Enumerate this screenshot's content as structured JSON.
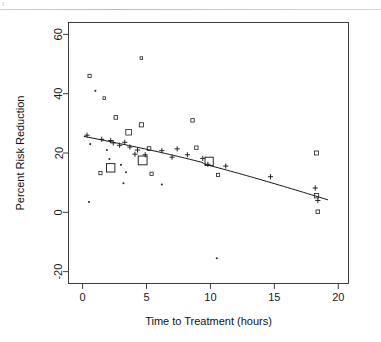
{
  "page": {
    "header_faint_text": "",
    "corner_mark": "I"
  },
  "chart_data": {
    "type": "scatter",
    "title": "",
    "xlabel": "Time to Treatment (hours)",
    "ylabel": "Percent Risk Reduction",
    "xlim": [
      -1.1,
      20.8
    ],
    "ylim": [
      -24,
      64
    ],
    "xticks": [
      0,
      5,
      10,
      15,
      20
    ],
    "xtick_labels": [
      "0",
      "5",
      "10",
      "15",
      "20"
    ],
    "yticks": [
      -20,
      0,
      20,
      40,
      60
    ],
    "ytick_labels": [
      "-20",
      "0",
      "20",
      "40",
      "60"
    ],
    "grid": false,
    "legend": null,
    "marker_styles": {
      "square": "open square (study estimate, size ~ weight)",
      "plus": "plus / cross",
      "dot": "small filled dot"
    },
    "series": [
      {
        "name": "Trials (square markers, size proportional to weight)",
        "marker": "square",
        "points": [
          {
            "x": 0.55,
            "y": 46.0,
            "size": 3.2
          },
          {
            "x": 4.6,
            "y": 52.0,
            "size": 2.6
          },
          {
            "x": 1.7,
            "y": 38.5,
            "size": 2.6
          },
          {
            "x": 2.6,
            "y": 32.0,
            "size": 3.6
          },
          {
            "x": 4.6,
            "y": 29.5,
            "size": 4.2
          },
          {
            "x": 3.6,
            "y": 27.0,
            "size": 5.6
          },
          {
            "x": 8.6,
            "y": 31.0,
            "size": 3.4
          },
          {
            "x": 18.3,
            "y": 20.0,
            "size": 4.0
          },
          {
            "x": 5.2,
            "y": 21.5,
            "size": 3.6
          },
          {
            "x": 8.9,
            "y": 21.8,
            "size": 3.4
          },
          {
            "x": 2.2,
            "y": 15.0,
            "size": 8.4
          },
          {
            "x": 4.7,
            "y": 17.5,
            "size": 8.8
          },
          {
            "x": 9.9,
            "y": 17.2,
            "size": 8.2
          },
          {
            "x": 1.4,
            "y": 13.2,
            "size": 3.2
          },
          {
            "x": 5.4,
            "y": 13.0,
            "size": 3.2
          },
          {
            "x": 10.6,
            "y": 12.6,
            "size": 3.2
          },
          {
            "x": 18.3,
            "y": 5.6,
            "size": 4.4
          },
          {
            "x": 18.4,
            "y": 0.2,
            "size": 3.6
          }
        ]
      },
      {
        "name": "Trials (plus markers)",
        "marker": "plus",
        "points": [
          {
            "x": 0.35,
            "y": 26.0
          },
          {
            "x": 1.5,
            "y": 24.6
          },
          {
            "x": 2.2,
            "y": 24.2
          },
          {
            "x": 2.4,
            "y": 23.4
          },
          {
            "x": 2.9,
            "y": 22.6
          },
          {
            "x": 3.3,
            "y": 23.6
          },
          {
            "x": 3.7,
            "y": 22.0
          },
          {
            "x": 4.3,
            "y": 21.0
          },
          {
            "x": 4.1,
            "y": 19.6
          },
          {
            "x": 4.9,
            "y": 19.4
          },
          {
            "x": 6.2,
            "y": 20.8
          },
          {
            "x": 7.0,
            "y": 18.6
          },
          {
            "x": 7.4,
            "y": 21.4
          },
          {
            "x": 8.2,
            "y": 19.4
          },
          {
            "x": 9.4,
            "y": 18.2
          },
          {
            "x": 9.8,
            "y": 16.2
          },
          {
            "x": 11.2,
            "y": 15.6
          },
          {
            "x": 14.7,
            "y": 12.0
          },
          {
            "x": 18.2,
            "y": 8.2
          },
          {
            "x": 18.4,
            "y": 4.0
          }
        ]
      },
      {
        "name": "Trials (small dot markers)",
        "marker": "dot",
        "points": [
          {
            "x": 1.0,
            "y": 41.0
          },
          {
            "x": 0.6,
            "y": 23.0
          },
          {
            "x": 1.9,
            "y": 21.0
          },
          {
            "x": 2.1,
            "y": 18.0
          },
          {
            "x": 3.0,
            "y": 16.0
          },
          {
            "x": 3.4,
            "y": 13.5
          },
          {
            "x": 3.2,
            "y": 9.8
          },
          {
            "x": 6.2,
            "y": 9.4
          },
          {
            "x": 10.5,
            "y": -15.5
          },
          {
            "x": 0.5,
            "y": 3.5
          }
        ]
      }
    ],
    "fit_line": {
      "name": "fitted meta-regression line",
      "x": [
        0.1,
        19.2
      ],
      "y": [
        25.6,
        5.2
      ],
      "curvature": "slightly concave (gentle downward curve)"
    }
  }
}
